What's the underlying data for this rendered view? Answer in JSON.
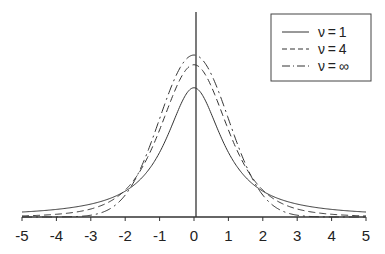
{
  "chart_data": {
    "type": "line",
    "title": "",
    "xlabel": "",
    "ylabel": "",
    "xlim": [
      -5,
      5
    ],
    "ylim": [
      0,
      0.42
    ],
    "grid": false,
    "legend_position": "top-right",
    "xticks": [
      -5,
      -4,
      -3,
      -2,
      -1,
      0,
      1,
      2,
      3,
      4,
      5
    ],
    "xtick_labels": [
      "-5",
      "-4",
      "-3",
      "-2",
      "-1",
      "0",
      "1",
      "2",
      "3",
      "4",
      "5"
    ],
    "series": [
      {
        "name": "ν=1",
        "label_prefix": "ν",
        "label_value": "1",
        "dof": 1,
        "style": "solid",
        "peak": 0.318
      },
      {
        "name": "ν=4",
        "label_prefix": "ν",
        "label_value": "4",
        "dof": 4,
        "style": "dashed",
        "peak": 0.375
      },
      {
        "name": "ν=∞",
        "label_prefix": "ν",
        "label_value": "∞",
        "dof": "infinity",
        "style": "dashdot",
        "peak": 0.399
      }
    ]
  }
}
